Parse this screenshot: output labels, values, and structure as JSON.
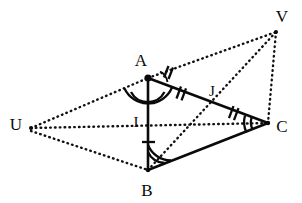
{
  "figure": {
    "type": "geometry-diagram",
    "canvas": {
      "width": 302,
      "height": 203,
      "background": "#ffffff"
    },
    "stroke_color": "#0a0a0a",
    "labels": {
      "A": "A",
      "B": "B",
      "C": "C",
      "U": "U",
      "V": "V",
      "I": "I",
      "J": "J"
    },
    "points": [
      {
        "name": "A",
        "label": "A",
        "x": 148,
        "y": 78,
        "label_x": 141,
        "label_y": 66,
        "dot": true
      },
      {
        "name": "B",
        "label": "B",
        "x": 148,
        "y": 170,
        "label_x": 142,
        "label_y": 192,
        "dot": false
      },
      {
        "name": "C",
        "label": "C",
        "x": 268,
        "y": 123,
        "label_x": 277,
        "label_y": 131,
        "dot": false
      },
      {
        "name": "U",
        "label": "U",
        "x": 31,
        "y": 128,
        "label_x": 12,
        "label_y": 128,
        "dot": false
      },
      {
        "name": "V",
        "label": "V",
        "x": 276,
        "y": 32,
        "label_x": 277,
        "label_y": 20,
        "dot": false
      },
      {
        "name": "I",
        "label": "I",
        "x": 148,
        "y": 124,
        "label_x": 134,
        "label_y": 123,
        "dot": false
      },
      {
        "name": "J",
        "label": "J",
        "x": 208,
        "y": 100,
        "label_x": 211,
        "label_y": 95,
        "dot": false
      }
    ],
    "solid_segments": [
      {
        "name": "segment-AB",
        "from": "A",
        "to": "B"
      },
      {
        "name": "segment-BC",
        "from": "B",
        "to": "C"
      },
      {
        "name": "segment-AC",
        "from": "A",
        "to": "C"
      }
    ],
    "dotted_segments": [
      {
        "name": "segment-UA",
        "from": "U",
        "to": "A"
      },
      {
        "name": "segment-AV",
        "from": "A",
        "to": "V"
      },
      {
        "name": "segment-UB",
        "from": "U",
        "to": "B"
      },
      {
        "name": "segment-UC",
        "from": "U",
        "to": "C"
      },
      {
        "name": "segment-BV",
        "from": "B",
        "to": "V"
      },
      {
        "name": "segment-VC",
        "from": "V",
        "to": "C"
      }
    ],
    "tick_marks": [
      {
        "name": "tick-AI",
        "on": "segment-AB",
        "count": 1,
        "t": 0.28
      },
      {
        "name": "tick-IB",
        "on": "segment-AB",
        "count": 1,
        "t": 0.7
      },
      {
        "name": "tick-AJ",
        "on": "segment-AC",
        "count": 2,
        "t": 0.3
      },
      {
        "name": "tick-JC",
        "on": "segment-AC",
        "count": 2,
        "t": 0.72
      }
    ],
    "angle_marks": [
      {
        "name": "angle-at-A",
        "vertex": "A",
        "arcs": 2
      },
      {
        "name": "angle-at-B",
        "vertex": "B",
        "arcs": 2
      },
      {
        "name": "angle-at-C",
        "vertex": "C",
        "arcs": 2
      },
      {
        "name": "angle-at-A-upper",
        "vertex": "A",
        "arcs": 1
      }
    ]
  }
}
